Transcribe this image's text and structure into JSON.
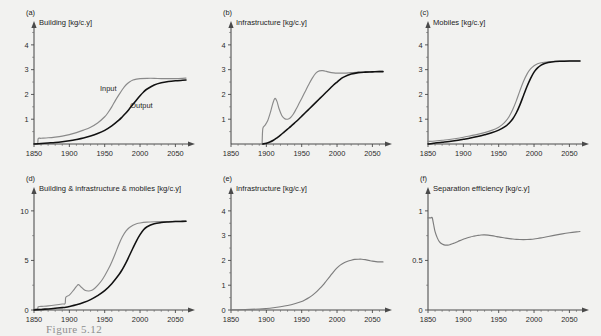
{
  "figure": {
    "caption": "Figure 5.12",
    "background_color": "#f2f2f0",
    "input_color": "#8a8a8a",
    "output_color": "#111111"
  },
  "chart_data": [
    {
      "type": "line",
      "panel": "a",
      "panel_letter": "(a)",
      "title": "Building [kg/c.y]",
      "ylabel": "Building [kg/c.y]",
      "xlabel": "",
      "xlim": [
        1850,
        2065
      ],
      "ylim": [
        0,
        4.6
      ],
      "xticks": [
        1850,
        1900,
        1950,
        2000,
        2050
      ],
      "yticks": [
        1,
        2,
        3,
        4
      ],
      "grid": false,
      "legend_position": "inline-annotation",
      "annotations": [
        {
          "text": "Input",
          "x": 1955,
          "y": 2.15
        },
        {
          "text": "Output",
          "x": 2002,
          "y": 1.45
        }
      ],
      "series": [
        {
          "name": "Input",
          "color": "#8a8a8a",
          "x": [
            1850,
            1855,
            1856,
            1860,
            1870,
            1880,
            1890,
            1900,
            1910,
            1920,
            1930,
            1940,
            1950,
            1955,
            1960,
            1965,
            1970,
            1975,
            1980,
            1985,
            1990,
            1995,
            2000,
            2010,
            2020,
            2030,
            2040,
            2050,
            2060,
            2065
          ],
          "values": [
            0.0,
            0.0,
            0.22,
            0.23,
            0.25,
            0.28,
            0.32,
            0.38,
            0.46,
            0.56,
            0.68,
            0.85,
            1.1,
            1.28,
            1.5,
            1.75,
            1.98,
            2.2,
            2.38,
            2.5,
            2.58,
            2.62,
            2.64,
            2.65,
            2.65,
            2.64,
            2.64,
            2.64,
            2.65,
            2.66
          ]
        },
        {
          "name": "Output",
          "color": "#111111",
          "x": [
            1850,
            1860,
            1870,
            1880,
            1890,
            1900,
            1910,
            1920,
            1930,
            1940,
            1950,
            1960,
            1970,
            1975,
            1980,
            1985,
            1990,
            1995,
            2000,
            2005,
            2010,
            2020,
            2030,
            2040,
            2050,
            2060,
            2065
          ],
          "values": [
            0.0,
            0.02,
            0.04,
            0.06,
            0.09,
            0.13,
            0.18,
            0.24,
            0.32,
            0.42,
            0.55,
            0.73,
            0.96,
            1.1,
            1.25,
            1.42,
            1.6,
            1.78,
            1.95,
            2.1,
            2.22,
            2.38,
            2.47,
            2.52,
            2.55,
            2.57,
            2.58
          ]
        }
      ]
    },
    {
      "type": "line",
      "panel": "b",
      "panel_letter": "(b)",
      "title": "Infrastructure [kg/c.y]",
      "ylabel": "Infrastructure [kg/c.y]",
      "xlabel": "",
      "xlim": [
        1850,
        2065
      ],
      "ylim": [
        0,
        4.6
      ],
      "xticks": [
        1850,
        1900,
        1950,
        2000,
        2050
      ],
      "yticks": [
        1,
        2,
        3,
        4
      ],
      "grid": false,
      "series": [
        {
          "name": "Input",
          "color": "#8a8a8a",
          "x": [
            1894,
            1895,
            1898,
            1902,
            1906,
            1909,
            1912,
            1915,
            1918,
            1922,
            1926,
            1930,
            1934,
            1938,
            1942,
            1946,
            1950,
            1955,
            1960,
            1965,
            1970,
            1975,
            1980,
            1985,
            1990,
            1995,
            2000,
            2010,
            2020,
            2030,
            2040,
            2050,
            2060,
            2065
          ],
          "values": [
            0.0,
            0.62,
            0.75,
            0.95,
            1.3,
            1.62,
            1.84,
            1.72,
            1.42,
            1.14,
            1.02,
            1.0,
            1.06,
            1.2,
            1.4,
            1.62,
            1.84,
            2.12,
            2.4,
            2.66,
            2.86,
            2.95,
            2.96,
            2.93,
            2.89,
            2.87,
            2.86,
            2.86,
            2.88,
            2.9,
            2.91,
            2.92,
            2.93,
            2.93
          ]
        },
        {
          "name": "Output",
          "color": "#111111",
          "x": [
            1895,
            1900,
            1905,
            1910,
            1915,
            1920,
            1925,
            1930,
            1935,
            1940,
            1945,
            1950,
            1955,
            1960,
            1965,
            1970,
            1975,
            1980,
            1985,
            1990,
            1995,
            2000,
            2005,
            2010,
            2020,
            2030,
            2040,
            2050,
            2060,
            2065
          ],
          "values": [
            0.0,
            0.03,
            0.08,
            0.15,
            0.25,
            0.36,
            0.48,
            0.6,
            0.72,
            0.85,
            0.98,
            1.12,
            1.26,
            1.4,
            1.54,
            1.68,
            1.82,
            1.96,
            2.1,
            2.24,
            2.38,
            2.5,
            2.62,
            2.71,
            2.82,
            2.88,
            2.9,
            2.91,
            2.92,
            2.92
          ]
        }
      ]
    },
    {
      "type": "line",
      "panel": "c",
      "panel_letter": "(c)",
      "title": "Mobiles [kg/c.y]",
      "ylabel": "Mobiles [kg/c.y]",
      "xlabel": "",
      "xlim": [
        1850,
        2065
      ],
      "ylim": [
        0,
        4.6
      ],
      "xticks": [
        1850,
        1900,
        1950,
        2000,
        2050
      ],
      "yticks": [
        1,
        2,
        3,
        4
      ],
      "grid": false,
      "series": [
        {
          "name": "Input",
          "color": "#8a8a8a",
          "x": [
            1850,
            1860,
            1870,
            1880,
            1890,
            1900,
            1910,
            1920,
            1930,
            1940,
            1950,
            1955,
            1960,
            1965,
            1970,
            1975,
            1980,
            1985,
            1990,
            1995,
            2000,
            2005,
            2010,
            2020,
            2030,
            2040,
            2050,
            2060,
            2065
          ],
          "values": [
            0.1,
            0.12,
            0.15,
            0.18,
            0.22,
            0.27,
            0.33,
            0.39,
            0.46,
            0.55,
            0.68,
            0.78,
            0.92,
            1.12,
            1.4,
            1.75,
            2.15,
            2.52,
            2.82,
            3.03,
            3.16,
            3.24,
            3.28,
            3.32,
            3.34,
            3.35,
            3.35,
            3.35,
            3.35
          ]
        },
        {
          "name": "Output",
          "color": "#111111",
          "x": [
            1850,
            1856,
            1860,
            1870,
            1880,
            1890,
            1900,
            1910,
            1920,
            1930,
            1940,
            1950,
            1960,
            1965,
            1970,
            1975,
            1980,
            1985,
            1990,
            1995,
            2000,
            2005,
            2010,
            2015,
            2020,
            2030,
            2040,
            2050,
            2060,
            2065
          ],
          "values": [
            0.0,
            0.02,
            0.04,
            0.07,
            0.1,
            0.14,
            0.19,
            0.24,
            0.3,
            0.37,
            0.45,
            0.56,
            0.72,
            0.85,
            1.02,
            1.26,
            1.58,
            1.95,
            2.32,
            2.64,
            2.9,
            3.07,
            3.18,
            3.25,
            3.29,
            3.33,
            3.34,
            3.35,
            3.35,
            3.35
          ]
        }
      ]
    },
    {
      "type": "line",
      "panel": "d",
      "panel_letter": "(d)",
      "title": "Building & infrastructure & mobiles [kg/c.y]",
      "ylabel": "Building & infrastructure & mobiles [kg/c.y]",
      "xlabel": "",
      "xlim": [
        1850,
        2065
      ],
      "ylim": [
        0,
        11.5
      ],
      "xticks": [
        1850,
        1900,
        1950,
        2000,
        2050
      ],
      "yticks": [
        0,
        5,
        10
      ],
      "grid": false,
      "series": [
        {
          "name": "Input",
          "color": "#8a8a8a",
          "x": [
            1850,
            1855,
            1856,
            1860,
            1870,
            1880,
            1890,
            1894,
            1895,
            1900,
            1906,
            1910,
            1913,
            1917,
            1922,
            1927,
            1931,
            1936,
            1941,
            1946,
            1950,
            1955,
            1960,
            1965,
            1970,
            1975,
            1980,
            1985,
            1990,
            1995,
            2000,
            2010,
            2020,
            2030,
            2040,
            2050,
            2060,
            2065
          ],
          "values": [
            0.1,
            0.12,
            0.33,
            0.36,
            0.42,
            0.5,
            0.6,
            0.66,
            1.28,
            1.5,
            2.0,
            2.38,
            2.56,
            2.3,
            2.0,
            1.92,
            1.96,
            2.2,
            2.56,
            3.0,
            3.45,
            4.1,
            4.85,
            5.7,
            6.6,
            7.38,
            7.95,
            8.32,
            8.55,
            8.7,
            8.78,
            8.86,
            8.9,
            8.92,
            8.93,
            8.94,
            8.95,
            8.96
          ]
        },
        {
          "name": "Output",
          "color": "#111111",
          "x": [
            1850,
            1860,
            1870,
            1880,
            1890,
            1895,
            1900,
            1910,
            1920,
            1930,
            1940,
            1950,
            1960,
            1970,
            1975,
            1980,
            1985,
            1990,
            1995,
            2000,
            2005,
            2010,
            2020,
            2030,
            2040,
            2050,
            2060,
            2065
          ],
          "values": [
            0.0,
            0.06,
            0.11,
            0.17,
            0.24,
            0.28,
            0.35,
            0.52,
            0.75,
            1.05,
            1.45,
            1.95,
            2.65,
            3.55,
            4.1,
            4.75,
            5.5,
            6.25,
            6.98,
            7.6,
            8.1,
            8.4,
            8.7,
            8.82,
            8.88,
            8.92,
            8.94,
            8.95
          ]
        }
      ]
    },
    {
      "type": "line",
      "panel": "e",
      "panel_letter": "(e)",
      "title": "Infrastructure [kg/c.y]",
      "ylabel": "Infrastructure [kg/c.y]",
      "xlabel": "",
      "xlim": [
        1850,
        2065
      ],
      "ylim": [
        0,
        4.6
      ],
      "xticks": [
        1850,
        1900,
        1950,
        2000,
        2050
      ],
      "yticks": [
        0,
        1,
        2,
        3,
        4
      ],
      "grid": false,
      "series": [
        {
          "name": "Infrastructure",
          "color": "#7d7d7d",
          "x": [
            1850,
            1870,
            1890,
            1900,
            1910,
            1920,
            1930,
            1940,
            1950,
            1955,
            1960,
            1965,
            1970,
            1975,
            1980,
            1985,
            1990,
            1995,
            2000,
            2005,
            2010,
            2015,
            2020,
            2025,
            2030,
            2035,
            2040,
            2045,
            2050,
            2055,
            2060,
            2065
          ],
          "values": [
            0.01,
            0.02,
            0.04,
            0.06,
            0.09,
            0.13,
            0.18,
            0.25,
            0.34,
            0.41,
            0.49,
            0.59,
            0.71,
            0.85,
            1.0,
            1.18,
            1.36,
            1.54,
            1.7,
            1.82,
            1.91,
            1.97,
            2.01,
            2.04,
            2.05,
            2.05,
            2.03,
            2.0,
            1.97,
            1.95,
            1.94,
            1.94
          ]
        }
      ]
    },
    {
      "type": "line",
      "panel": "f",
      "panel_letter": "(f)",
      "title": "Separation efficiency [kg/c.y]",
      "ylabel": "Separation efficiency [kg/c.y]",
      "xlabel": "",
      "xlim": [
        1850,
        2065
      ],
      "ylim": [
        0,
        1.15
      ],
      "xticks": [
        1850,
        1900,
        1950,
        2000,
        2050
      ],
      "yticks": [
        0,
        0.5,
        1
      ],
      "grid": false,
      "series": [
        {
          "name": "Separation efficiency",
          "color": "#7d7d7d",
          "x": [
            1850,
            1854,
            1856,
            1858,
            1860,
            1863,
            1866,
            1870,
            1874,
            1878,
            1882,
            1886,
            1890,
            1895,
            1900,
            1905,
            1910,
            1915,
            1920,
            1925,
            1930,
            1935,
            1940,
            1945,
            1950,
            1955,
            1960,
            1965,
            1970,
            1975,
            1980,
            1985,
            1990,
            1995,
            2000,
            2005,
            2010,
            2015,
            2020,
            2030,
            2040,
            2050,
            2060,
            2065
          ],
          "values": [
            0.93,
            0.93,
            0.93,
            0.86,
            0.79,
            0.73,
            0.69,
            0.665,
            0.655,
            0.655,
            0.662,
            0.672,
            0.683,
            0.7,
            0.714,
            0.727,
            0.737,
            0.745,
            0.752,
            0.757,
            0.758,
            0.755,
            0.75,
            0.744,
            0.737,
            0.731,
            0.725,
            0.72,
            0.716,
            0.713,
            0.711,
            0.71,
            0.711,
            0.713,
            0.716,
            0.721,
            0.727,
            0.734,
            0.741,
            0.755,
            0.768,
            0.779,
            0.788,
            0.792
          ]
        }
      ]
    }
  ]
}
